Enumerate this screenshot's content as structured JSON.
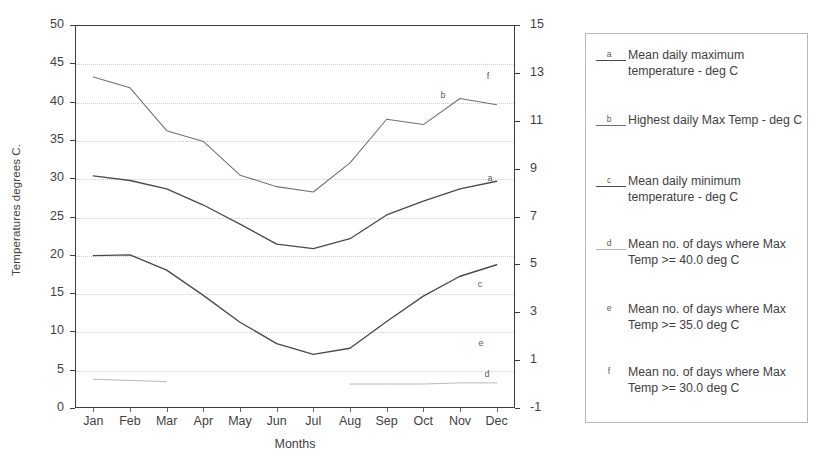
{
  "chart_data": {
    "type": "line",
    "title": "",
    "xlabel": "Months",
    "ylabel": "Temperatures degrees C.",
    "ylabel_secondary": "",
    "categories": [
      "Jan",
      "Feb",
      "Mar",
      "Apr",
      "May",
      "Jun",
      "Jul",
      "Aug",
      "Sep",
      "Oct",
      "Nov",
      "Dec"
    ],
    "ylim": [
      0,
      50
    ],
    "yticks": [
      0,
      5,
      10,
      15,
      20,
      25,
      30,
      35,
      40,
      45,
      50
    ],
    "ylim_secondary": [
      -1,
      15
    ],
    "yticks_secondary": [
      -1,
      1,
      3,
      5,
      7,
      9,
      11,
      13,
      15
    ],
    "grid": true,
    "legend_position": "right-outside",
    "series": [
      {
        "key": "a",
        "name": "Mean daily maximum temperature - deg C",
        "axis": "left",
        "values": [
          30.3,
          29.7,
          28.6,
          26.5,
          24.0,
          21.4,
          20.8,
          22.1,
          25.2,
          27.0,
          28.6,
          29.6
        ]
      },
      {
        "key": "b",
        "name": "Highest daily Max Temp - deg C",
        "axis": "left",
        "values": [
          43.2,
          41.8,
          36.2,
          34.8,
          30.4,
          28.9,
          28.2,
          32.0,
          37.7,
          37.0,
          40.4,
          39.6
        ]
      },
      {
        "key": "c",
        "name": "Mean daily minimum temperature - deg C",
        "axis": "left",
        "values": [
          19.9,
          20.0,
          18.0,
          14.7,
          11.2,
          8.4,
          7.0,
          7.8,
          11.3,
          14.6,
          17.2,
          18.7
        ]
      },
      {
        "key": "d",
        "name": "Mean no. of days where Max Temp >= 40.0 deg C",
        "axis": "right",
        "values": [
          0.2,
          0.15,
          0.1,
          null,
          null,
          null,
          null,
          0.0,
          0.0,
          0.0,
          0.05,
          0.05
        ]
      },
      {
        "key": "e",
        "name": "Mean no. of days where Max Temp >= 35.0 deg C",
        "axis": "right",
        "values": [
          null,
          null,
          null,
          null,
          null,
          null,
          null,
          null,
          null,
          null,
          null,
          null
        ]
      },
      {
        "key": "f",
        "name": "Mean no. of days where Max Temp >= 30.0 deg C",
        "axis": "right",
        "values": [
          null,
          null,
          null,
          null,
          null,
          null,
          null,
          null,
          null,
          null,
          null,
          null
        ]
      }
    ],
    "plot_labels": [
      {
        "key": "a",
        "text": "a",
        "x": 490,
        "y": 178
      },
      {
        "key": "b",
        "text": "b",
        "x": 443,
        "y": 95
      },
      {
        "key": "c",
        "text": "c",
        "x": 480,
        "y": 284
      },
      {
        "key": "d",
        "text": "d",
        "x": 487,
        "y": 374
      },
      {
        "key": "e",
        "text": "e",
        "x": 481,
        "y": 343
      },
      {
        "key": "f",
        "text": "f",
        "x": 488,
        "y": 76
      }
    ]
  },
  "legend": {
    "entries": [
      {
        "key": "a",
        "label": "Mean daily maximum temperature - deg C"
      },
      {
        "key": "b",
        "label": "Highest daily Max Temp - deg C"
      },
      {
        "key": "c",
        "label": "Mean daily minimum temperature - deg C"
      },
      {
        "key": "d",
        "label": "Mean no. of days where Max Temp >= 40.0 deg C"
      },
      {
        "key": "e",
        "label": "Mean no. of days where Max Temp >= 35.0 deg C"
      },
      {
        "key": "f",
        "label": "Mean no. of days where Max Temp >= 30.0 deg C"
      }
    ]
  },
  "colors": {
    "axis": "#3c3c3c",
    "grid": "#cfcfcf",
    "series_a": "#4a4a4a",
    "series_b": "#707070",
    "series_c": "#4a4a4a",
    "series_d": "#b0b0b0",
    "text": "#3f3f3f",
    "legend_border": "#b9b9b9"
  }
}
